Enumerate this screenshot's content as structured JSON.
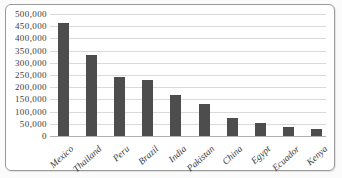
{
  "chart_data": {
    "type": "bar",
    "title": "",
    "xlabel": "",
    "ylabel": "",
    "categories": [
      "Mexico",
      "Thailand",
      "Peru",
      "Brazil",
      "India",
      "Pakistan",
      "China",
      "Egypt",
      "Ecuador",
      "Kenya"
    ],
    "values": [
      465000,
      330000,
      240000,
      230000,
      170000,
      130000,
      75000,
      55000,
      35000,
      30000
    ],
    "ylim": [
      0,
      500000
    ],
    "ytick_step": 50000,
    "ytick_labels": [
      "500,000",
      "450,000",
      "400,000",
      "350,000",
      "300,000",
      "250,000",
      "200,000",
      "150,000",
      "100,000",
      "50,000",
      "0"
    ],
    "grid": "horizontal",
    "legend": "none",
    "colors": {
      "bar": "#4d4d4d",
      "gridline": "#d9d9d9",
      "axis_line": "#b0b0b0",
      "text": "#3d3d3d",
      "frame_border": "#9a9a9a",
      "plot_background": "#ffffff"
    }
  }
}
